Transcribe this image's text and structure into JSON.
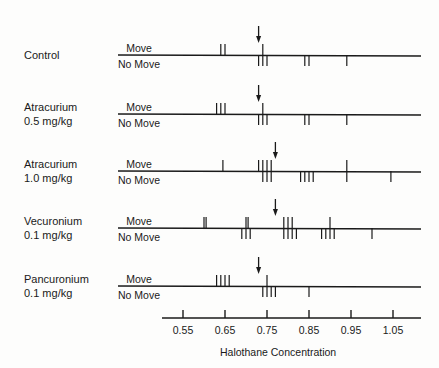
{
  "chart_data": {
    "type": "scatter",
    "subtype": "up-and-down tick plot",
    "title": "",
    "xlabel": "Halothane Concentration",
    "ylabel": "",
    "xlim": [
      0.5,
      1.12
    ],
    "xticks": [
      0.55,
      0.65,
      0.75,
      0.85,
      0.95,
      1.05
    ],
    "xtick_labels": [
      "0.55",
      "0.65",
      "0.75",
      "0.85",
      "0.95",
      "1.05"
    ],
    "grid": false,
    "legend": null,
    "row_labels": {
      "above": "Move",
      "below": "No Move"
    },
    "series": [
      {
        "name": "Control",
        "dose": "",
        "arrow": 0.73,
        "move": [
          0.64,
          0.65,
          0.74
        ],
        "no_move": [
          0.73,
          0.74,
          0.75,
          0.84,
          0.85,
          0.94
        ]
      },
      {
        "name": "Atracurium",
        "dose": "0.5 mg/kg",
        "arrow": 0.73,
        "move": [
          0.63,
          0.64,
          0.65,
          0.74
        ],
        "no_move": [
          0.73,
          0.74,
          0.75,
          0.84,
          0.85,
          0.94
        ]
      },
      {
        "name": "Atracurium",
        "dose": "1.0 mg/kg",
        "arrow": 0.77,
        "move": [
          0.645,
          0.73,
          0.74,
          0.75,
          0.76,
          0.94
        ],
        "no_move": [
          0.74,
          0.75,
          0.76,
          0.83,
          0.84,
          0.85,
          0.86,
          0.94,
          1.045
        ]
      },
      {
        "name": "Vecuronium",
        "dose": "0.1 mg/kg",
        "arrow": 0.77,
        "move": [
          0.6,
          0.605,
          0.7,
          0.705,
          0.79,
          0.8,
          0.81,
          0.9
        ],
        "no_move": [
          0.69,
          0.7,
          0.71,
          0.79,
          0.8,
          0.81,
          0.82,
          0.88,
          0.89,
          0.9,
          0.91,
          1.0
        ]
      },
      {
        "name": "Pancuronium",
        "dose": "0.1 mg/kg",
        "arrow": 0.73,
        "move": [
          0.63,
          0.64,
          0.65,
          0.66,
          0.75
        ],
        "no_move": [
          0.74,
          0.75,
          0.76,
          0.77,
          0.85
        ]
      }
    ]
  },
  "groups": [
    {
      "name": "Control",
      "dose": ""
    },
    {
      "name": "Atracurium",
      "dose": "0.5 mg/kg"
    },
    {
      "name": "Atracurium",
      "dose": "1.0 mg/kg"
    },
    {
      "name": "Vecuronium",
      "dose": "0.1 mg/kg"
    },
    {
      "name": "Pancuronium",
      "dose": "0.1 mg/kg"
    }
  ],
  "labels": {
    "move": "Move",
    "no_move": "No Move"
  },
  "axis": {
    "title": "Halothane Concentration",
    "ticks": [
      "0.55",
      "0.65",
      "0.75",
      "0.85",
      "0.95",
      "1.05"
    ]
  },
  "colors": {
    "ink": "#1a1a1a",
    "paper": "#fdfdfc"
  }
}
